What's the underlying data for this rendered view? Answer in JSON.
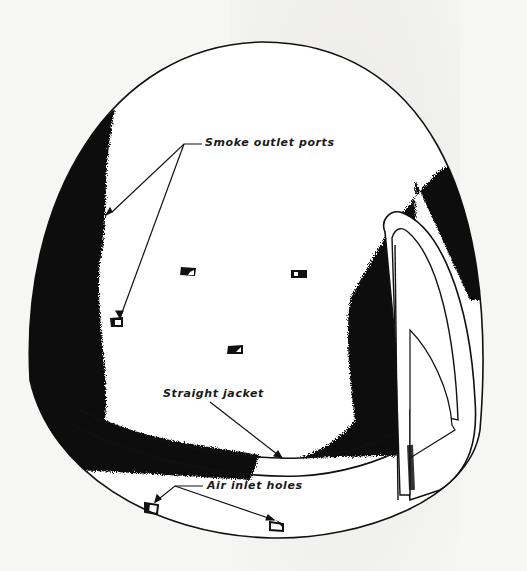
{
  "figure": {
    "labels": {
      "smoke_outlet_ports": "Smoke outlet ports",
      "straight_jacket": "Straight jacket",
      "air_inlet_holes": "Air inlet holes"
    },
    "colors": {
      "ink": "#111111",
      "paper": "#f6f6f4",
      "dome_fill": "#ffffff"
    }
  }
}
